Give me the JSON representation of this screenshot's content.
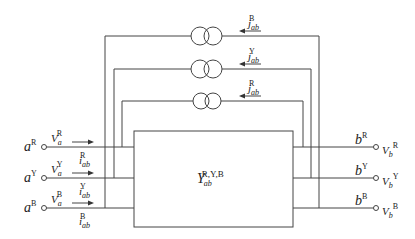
{
  "diagram": {
    "type": "three-phase two-port network with controlled current sources",
    "block": {
      "label": "Y",
      "sub": "ab",
      "sup": "R,Y,B"
    },
    "left_ports": [
      {
        "node": "a",
        "phase": "R",
        "voltage": "V",
        "v_sub": "a",
        "v_sup": "R",
        "current": "i",
        "i_sub": "ab",
        "i_sup": "R"
      },
      {
        "node": "a",
        "phase": "Y",
        "voltage": "V",
        "v_sub": "a",
        "v_sup": "Y",
        "current": "i",
        "i_sub": "ab",
        "i_sup": "Y"
      },
      {
        "node": "a",
        "phase": "B",
        "voltage": "V",
        "v_sub": "a",
        "v_sup": "B",
        "current": "i",
        "i_sub": "ab",
        "i_sup": "B"
      }
    ],
    "right_ports": [
      {
        "node": "b",
        "phase": "R",
        "voltage": "V",
        "v_sub": "b",
        "v_sup": "R"
      },
      {
        "node": "b",
        "phase": "Y",
        "voltage": "V",
        "v_sub": "b",
        "v_sup": "Y"
      },
      {
        "node": "b",
        "phase": "B",
        "voltage": "V",
        "v_sub": "b",
        "v_sup": "B"
      }
    ],
    "current_sources": [
      {
        "label": "j",
        "sub": "ab",
        "sup": "B"
      },
      {
        "label": "j",
        "sub": "ab",
        "sup": "Y"
      },
      {
        "label": "j",
        "sub": "ab",
        "sup": "R"
      }
    ],
    "line_color": "#444444"
  }
}
